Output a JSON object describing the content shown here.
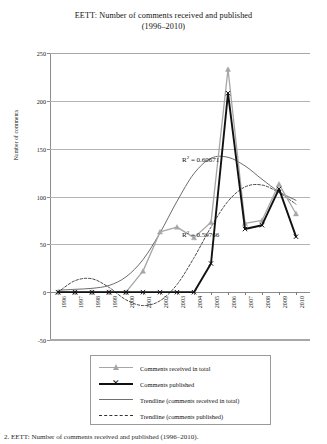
{
  "title": {
    "line1": "EETT: Number of comments received and published",
    "line2": "(1996–2010)"
  },
  "axes": {
    "ylabel": "Number of comments",
    "yticks": [
      "250",
      "200",
      "150",
      "100",
      "50",
      "0",
      "-50"
    ],
    "xticks": [
      "1996",
      "1997",
      "1998",
      "1999",
      "2000",
      "2001",
      "2002",
      "2003",
      "2004",
      "2005",
      "2006",
      "2007",
      "2008",
      "2009",
      "2010"
    ]
  },
  "annotations": {
    "r2_received_prefix": "R",
    "r2_received_sup": "2",
    "r2_received_value": " = 0.60671",
    "r2_published_prefix": "R",
    "r2_published_sup": "2",
    "r2_published_value": " = 0.59766"
  },
  "legend": {
    "items": [
      {
        "label": "Comments received in total",
        "style": "gray-triangle"
      },
      {
        "label": "Comments published",
        "style": "black-x"
      },
      {
        "label": "Trendline (comments received in total)",
        "style": "solid-gray"
      },
      {
        "label": "Trendline (comments published)",
        "style": "dashed"
      }
    ]
  },
  "caption": {
    "text": "2. EETT: Number of comments received and published (1996–2010)."
  },
  "colors": {
    "received": "#a6a6a6",
    "published": "#111111",
    "trend_received": "#5a5a5a",
    "trend_published": "#333333",
    "grid": "#b4b4b4",
    "axis": "#8a8a8a"
  },
  "chart_data": {
    "type": "line",
    "title": "EETT: Number of comments received and published (1996–2010)",
    "xlabel": "",
    "ylabel": "Number of comments",
    "categories": [
      "1996",
      "1997",
      "1998",
      "1999",
      "2000",
      "2001",
      "2002",
      "2003",
      "2004",
      "2005",
      "2006",
      "2007",
      "2008",
      "2009",
      "2010"
    ],
    "ylim": [
      -50,
      250
    ],
    "ytick_step": 50,
    "grid": true,
    "legend_position": "below",
    "series": [
      {
        "name": "Comments received in total",
        "marker": "triangle",
        "color": "#a6a6a6",
        "values": [
          0,
          0,
          0,
          0,
          0,
          22,
          63,
          68,
          57,
          73,
          233,
          72,
          75,
          113,
          82
        ]
      },
      {
        "name": "Comments published",
        "marker": "x",
        "color": "#111111",
        "values": [
          0,
          0,
          0,
          0,
          0,
          0,
          0,
          0,
          0,
          30,
          208,
          66,
          70,
          108,
          58
        ]
      },
      {
        "name": "Trendline (comments received in total)",
        "marker": "none",
        "style": "solid",
        "color": "#5a5a5a",
        "values": [
          2,
          3,
          4,
          7,
          16,
          34,
          62,
          95,
          124,
          140,
          141,
          132,
          118,
          105,
          96
        ]
      },
      {
        "name": "Trendline (comments published)",
        "marker": "none",
        "style": "dashed",
        "color": "#333333",
        "values": [
          0,
          12,
          14,
          5,
          -8,
          -14,
          -9,
          8,
          36,
          68,
          95,
          110,
          112,
          104,
          92
        ]
      }
    ],
    "annotations": [
      {
        "text": "R² = 0.60671",
        "series": "Trendline (comments received in total)"
      },
      {
        "text": "R² = 0.59766",
        "series": "Trendline (comments published)"
      }
    ]
  }
}
